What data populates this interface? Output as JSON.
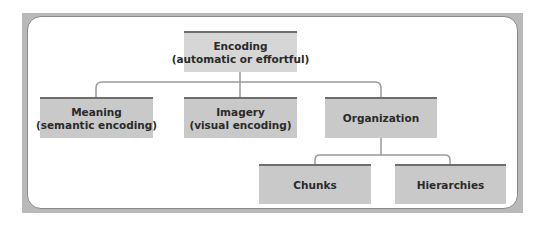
{
  "diagram": {
    "root": {
      "title": "Encoding",
      "subtitle": "(automatic or effortful)"
    },
    "level1": [
      {
        "title": "Meaning",
        "subtitle": "(semantic encoding)"
      },
      {
        "title": "Imagery",
        "subtitle": "(visual encoding)"
      },
      {
        "title": "Organization",
        "subtitle": ""
      }
    ],
    "level2": [
      {
        "title": "Chunks"
      },
      {
        "title": "Hierarchies"
      }
    ],
    "colors": {
      "frame": "#b9b9b9",
      "box_fill": "#c9c9c9",
      "root_fill": "#d6d6d6",
      "box_top_bar": "#6e6e6e",
      "connector": "#9a9a9a",
      "text": "#2a2a2a"
    }
  }
}
